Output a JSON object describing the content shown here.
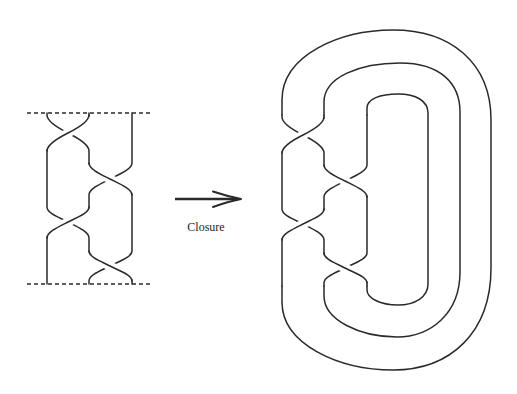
{
  "figure": {
    "arrow_label": "Closure",
    "left_panel": {
      "kind": "braid",
      "strand_count": 3,
      "crossing_count": 4,
      "boundaries": [
        "top dashed line",
        "bottom dashed line"
      ],
      "crossings": [
        {
          "index": 1,
          "between_positions": "1-2",
          "over_strand": "middle-to-left"
        },
        {
          "index": 2,
          "between_positions": "2-3",
          "over_strand": "middle-to-right"
        },
        {
          "index": 3,
          "between_positions": "1-2",
          "over_strand": "middle-to-left"
        },
        {
          "index": 4,
          "between_positions": "2-3",
          "over_strand": "middle-to-right"
        }
      ]
    },
    "right_panel": {
      "kind": "braid closure",
      "closing_arcs": [
        "outer",
        "middle",
        "inner"
      ],
      "crossing_count": 4
    }
  },
  "style": {
    "line_color": "#2a2a2a",
    "background": "#ffffff"
  }
}
